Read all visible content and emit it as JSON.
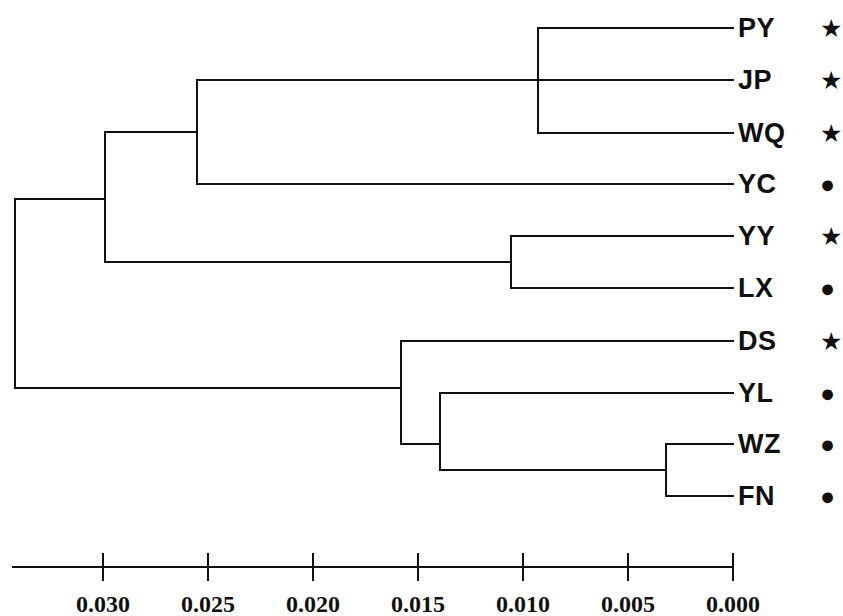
{
  "figure": {
    "type": "dendrogram",
    "line_color": "#101010",
    "background_color": "#ffffff",
    "line_width": 2
  },
  "chart_data": {
    "type": "dendrogram",
    "title": "",
    "xlabel": "",
    "ylabel": "",
    "orientation": "right-to-left",
    "distance_metric": "genetic distance",
    "axis": {
      "ticks": [
        "0.030",
        "0.025",
        "0.020",
        "0.015",
        "0.010",
        "0.005",
        "0.000"
      ],
      "tick_values": [
        0.03,
        0.025,
        0.02,
        0.015,
        0.01,
        0.005,
        0.0
      ],
      "tick_x": [
        103,
        208,
        313,
        418,
        523,
        628,
        733
      ],
      "axis_line_x_start": 13,
      "axis_line_x_end": 733,
      "axis_line_y": 567,
      "tick_length": 13,
      "label_y": 592,
      "min": 0.0,
      "max": 0.03,
      "grid": false
    },
    "leaves": [
      {
        "label": "PY",
        "symbol": "star",
        "glyph": "★",
        "row": 0,
        "y": 28,
        "branch_x": 538
      },
      {
        "label": "JP",
        "symbol": "star",
        "glyph": "★",
        "row": 1,
        "y": 80,
        "branch_x": 538
      },
      {
        "label": "WQ",
        "symbol": "star",
        "glyph": "★",
        "row": 2,
        "y": 133,
        "branch_x": 538
      },
      {
        "label": "YC",
        "symbol": "circle",
        "glyph": "●",
        "row": 3,
        "y": 184,
        "branch_x": 197
      },
      {
        "label": "YY",
        "symbol": "star",
        "glyph": "★",
        "row": 4,
        "y": 236,
        "branch_x": 511
      },
      {
        "label": "LX",
        "symbol": "circle",
        "glyph": "●",
        "row": 5,
        "y": 288,
        "branch_x": 511
      },
      {
        "label": "DS",
        "symbol": "star",
        "glyph": "★",
        "row": 6,
        "y": 341,
        "branch_x": 401
      },
      {
        "label": "YL",
        "symbol": "circle",
        "glyph": "●",
        "row": 7,
        "y": 393,
        "branch_x": 440
      },
      {
        "label": "WZ",
        "symbol": "circle",
        "glyph": "●",
        "row": 8,
        "y": 444,
        "branch_x": 666
      },
      {
        "label": "FN",
        "symbol": "circle",
        "glyph": "●",
        "row": 9,
        "y": 496,
        "branch_x": 666
      }
    ],
    "label_x": 738,
    "symbol_x": 820,
    "tip_x": 733,
    "nodes": [
      {
        "id": "n_root",
        "x": 15,
        "distance": 0.0342,
        "y_top": 199,
        "y_bottom": 388,
        "parent_x": null,
        "children": [
          "n_upper",
          "n_lower"
        ]
      },
      {
        "id": "n_upper",
        "x": 105,
        "distance": 0.0299,
        "y_top": 132,
        "y_bottom": 262,
        "parent_x": 15,
        "y": 199,
        "children": [
          "n_pjwy",
          "n_yylx"
        ]
      },
      {
        "id": "n_pjwy",
        "x": 197,
        "distance": 0.0255,
        "y_top": 80,
        "y_bottom": 184,
        "parent_x": 105,
        "y": 132,
        "children": [
          "n_pjw",
          "YC"
        ]
      },
      {
        "id": "n_pjw",
        "x": 538,
        "distance": 0.0093,
        "y_top": 28,
        "y_bottom": 133,
        "parent_x": 197,
        "y": 80,
        "children": [
          "PY",
          "JP",
          "WQ"
        ]
      },
      {
        "id": "n_yylx",
        "x": 511,
        "distance": 0.0106,
        "y_top": 236,
        "y_bottom": 288,
        "parent_x": 105,
        "y": 262,
        "children": [
          "YY",
          "LX"
        ]
      },
      {
        "id": "n_lower",
        "x": 401,
        "distance": 0.0158,
        "y_top": 341,
        "y_bottom": 444,
        "parent_x": 15,
        "y": 388,
        "children": [
          "DS",
          "n_ylwf"
        ]
      },
      {
        "id": "n_ylwf",
        "x": 440,
        "distance": 0.014,
        "y_top": 393,
        "y_bottom": 470,
        "parent_x": 401,
        "y": 444,
        "children": [
          "YL",
          "n_wzfn"
        ]
      },
      {
        "id": "n_wzfn",
        "x": 666,
        "distance": 0.0032,
        "y_top": 444,
        "y_bottom": 496,
        "parent_x": 440,
        "y": 470,
        "children": [
          "WZ",
          "FN"
        ]
      }
    ],
    "segments": {
      "horizontal": [
        {
          "name": "tip-PY",
          "x1": 538,
          "x2": 733,
          "y": 28
        },
        {
          "name": "tip-JP",
          "x1": 538,
          "x2": 733,
          "y": 80
        },
        {
          "name": "tip-WQ",
          "x1": 538,
          "x2": 733,
          "y": 133
        },
        {
          "name": "tip-YC",
          "x1": 197,
          "x2": 733,
          "y": 184
        },
        {
          "name": "tip-YY",
          "x1": 511,
          "x2": 733,
          "y": 236
        },
        {
          "name": "tip-LX",
          "x1": 511,
          "x2": 733,
          "y": 288
        },
        {
          "name": "tip-DS",
          "x1": 401,
          "x2": 733,
          "y": 341
        },
        {
          "name": "tip-YL",
          "x1": 440,
          "x2": 733,
          "y": 393
        },
        {
          "name": "tip-WZ",
          "x1": 666,
          "x2": 733,
          "y": 444
        },
        {
          "name": "tip-FN",
          "x1": 666,
          "x2": 733,
          "y": 496
        },
        {
          "name": "branch-pjw",
          "x1": 197,
          "x2": 538,
          "y": 80
        },
        {
          "name": "branch-pjwy",
          "x1": 105,
          "x2": 197,
          "y": 132
        },
        {
          "name": "branch-yylx",
          "x1": 105,
          "x2": 511,
          "y": 262
        },
        {
          "name": "branch-upper",
          "x1": 15,
          "x2": 105,
          "y": 199
        },
        {
          "name": "branch-lower",
          "x1": 15,
          "x2": 401,
          "y": 388
        },
        {
          "name": "branch-ylwf",
          "x1": 401,
          "x2": 440,
          "y": 444
        },
        {
          "name": "branch-wzfn",
          "x1": 440,
          "x2": 666,
          "y": 470
        }
      ],
      "vertical": [
        {
          "name": "node-pjw",
          "x": 538,
          "y1": 28,
          "y2": 133
        },
        {
          "name": "node-pjwy",
          "x": 197,
          "y1": 80,
          "y2": 184
        },
        {
          "name": "node-yylx",
          "x": 511,
          "y1": 236,
          "y2": 288
        },
        {
          "name": "node-upper",
          "x": 105,
          "y1": 132,
          "y2": 262
        },
        {
          "name": "node-root",
          "x": 15,
          "y1": 199,
          "y2": 388
        },
        {
          "name": "node-lower",
          "x": 401,
          "y1": 341,
          "y2": 444
        },
        {
          "name": "node-ylwf",
          "x": 440,
          "y1": 393,
          "y2": 470
        },
        {
          "name": "node-wzfn",
          "x": 666,
          "y1": 444,
          "y2": 496
        }
      ]
    },
    "legend": {
      "star_glyph": "★",
      "circle_glyph": "●",
      "entries": [
        {
          "symbol": "star",
          "count": 5
        },
        {
          "symbol": "circle",
          "count": 5
        }
      ]
    }
  }
}
